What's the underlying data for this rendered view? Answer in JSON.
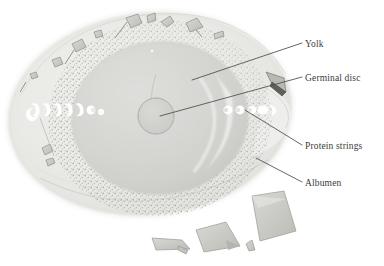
{
  "diagram": {
    "style": "pale grayscale watercolor anatomical illustration",
    "background_color": "#ffffff"
  },
  "colors": {
    "albumen": "#e9e9e6",
    "albumen_edge": "#cfcfca",
    "yolk": "#d5d5d2",
    "yolk_edge": "#bcbcb8",
    "germinal_disc": "#d2d2cf",
    "germinal_disc_edge": "#8f8f8c",
    "chalaza_white": "#ffffff",
    "shell_fragment": "#c9c9c4",
    "shell_fragment_dark": "#6e6e6a",
    "stipple": "#b7b7b2",
    "leader_line": "#4a4a4a",
    "label_text": "#3b3b3b"
  },
  "labels": [
    {
      "id": "yolk",
      "text": "Yolk",
      "text_x": 305,
      "text_y": 46,
      "leader_from_x": 302,
      "leader_from_y": 43,
      "leader_to_x": 192,
      "leader_to_y": 80
    },
    {
      "id": "germinal-disc",
      "text": "Germinal disc",
      "text_x": 305,
      "text_y": 80,
      "leader_from_x": 302,
      "leader_from_y": 77,
      "leader_to_x": 160,
      "leader_to_y": 116
    },
    {
      "id": "protein-strings",
      "text": "Protein strings",
      "text_x": 305,
      "text_y": 148,
      "leader_from_x": 302,
      "leader_from_y": 145,
      "leader_to_x": 245,
      "leader_to_y": 110
    },
    {
      "id": "albumen",
      "text": "Albumen",
      "text_x": 305,
      "text_y": 185,
      "leader_from_x": 302,
      "leader_from_y": 182,
      "leader_to_x": 256,
      "leader_to_y": 158
    }
  ],
  "parts": {
    "albumen": {
      "name": "Albumen",
      "center_x": 150,
      "center_y": 114,
      "radius_x": 143,
      "radius_y": 102,
      "rotation_deg": -6
    },
    "yolk": {
      "name": "Yolk",
      "center_x": 160,
      "center_y": 118,
      "radius_x": 88,
      "radius_y": 76,
      "rotation_deg": -4
    },
    "germinal_disc": {
      "name": "Germinal disc",
      "center_x": 156,
      "center_y": 116,
      "radius": 18
    },
    "protein_strings": {
      "name": "Protein strings",
      "left_count": 6,
      "right_count": 4,
      "midline_y": 110
    },
    "shell_fragments": {
      "name": "Shell fragments",
      "on_rim_count": 9,
      "loose_below_count": 4
    }
  }
}
